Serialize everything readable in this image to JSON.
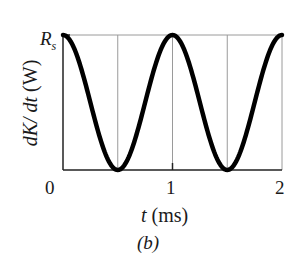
{
  "chart_data": {
    "type": "line",
    "title": "",
    "caption": "(b)",
    "xlabel": "t (ms)",
    "xlabel_var": "t",
    "xlabel_unit": "(ms)",
    "ylabel": "dK/dt (W)",
    "ylabel_var": "dK/ dt",
    "ylabel_unit": "(W)",
    "xlim": [
      0,
      2
    ],
    "ylim": [
      0,
      1
    ],
    "x_ticks": [
      "0",
      "1",
      "2"
    ],
    "y_ticks": [
      "0",
      "R_s"
    ],
    "y_tick_top": "R",
    "y_tick_top_sub": "s",
    "grid": {
      "vertical_at": [
        0.5,
        1,
        1.5,
        2
      ],
      "horizontal_at": [
        1
      ]
    },
    "legend": null,
    "series": [
      {
        "name": "dK/dt",
        "formula": "R_s * cos^2(pi * t / 1ms)",
        "x": [
          0,
          0.125,
          0.25,
          0.375,
          0.5,
          0.625,
          0.75,
          0.875,
          1.0,
          1.125,
          1.25,
          1.375,
          1.5,
          1.625,
          1.75,
          1.875,
          2.0
        ],
        "values": [
          1,
          0.854,
          0.5,
          0.146,
          0,
          0.146,
          0.5,
          0.854,
          1,
          0.854,
          0.5,
          0.146,
          0,
          0.146,
          0.5,
          0.854,
          1
        ]
      }
    ]
  }
}
